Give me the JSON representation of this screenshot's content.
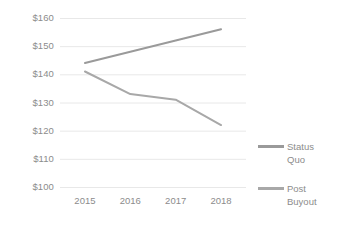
{
  "chart_data": {
    "type": "line",
    "title": "",
    "xlabel": "",
    "ylabel": "",
    "x": [
      "2015",
      "2016",
      "2017",
      "2018"
    ],
    "categories": [
      "2015",
      "2016",
      "2017",
      "2018"
    ],
    "series": [
      {
        "name": "Status Quo",
        "legend_label": "Status\nQuo",
        "color": "#9a9a9a",
        "values": [
          144,
          148,
          152,
          156
        ]
      },
      {
        "name": "Post Buyout",
        "legend_label": "Post\nBuyout",
        "color": "#a8a8a8",
        "values": [
          141,
          133,
          131,
          122
        ]
      }
    ],
    "ylim": [
      100,
      160
    ],
    "yticks": [
      100,
      110,
      120,
      130,
      140,
      150,
      160
    ],
    "ytick_labels": [
      "$100",
      "$110",
      "$120",
      "$130",
      "$140",
      "$150",
      "$160"
    ],
    "xtick_labels": [
      "2015",
      "2016",
      "2017",
      "2018"
    ],
    "grid": true,
    "grid_color": "#e8e8e8",
    "legend_position": "right",
    "axis_text_color": "#8c8c8c"
  }
}
